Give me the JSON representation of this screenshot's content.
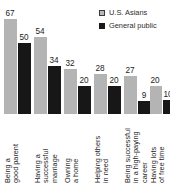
{
  "chart_data": {
    "type": "bar",
    "title": "",
    "subtitle": "",
    "xlabel": "",
    "ylabel": "",
    "ylim": [
      0,
      75
    ],
    "grid": false,
    "legend_position": "top-right",
    "orientation": "vertical",
    "grouping": "grouped",
    "categories": [
      "Being a\ngood parent",
      "Having a\nsuccessful\nmarriage",
      "Owning\na home",
      "Helping others\nin need",
      "Being successful\nin a high-paying\ncareer",
      "Having lots\nof free time"
    ],
    "series": [
      {
        "name": "U.S. Asians",
        "color": "#b4b4b4",
        "values": [
          67,
          54,
          32,
          28,
          27,
          20
        ]
      },
      {
        "name": "General public",
        "color": "#171717",
        "values": [
          50,
          34,
          20,
          20,
          9,
          10
        ]
      }
    ],
    "value_labels": [
      [
        "67",
        "50"
      ],
      [
        "54",
        "34"
      ],
      [
        "32",
        "20"
      ],
      [
        "28",
        "20"
      ],
      [
        "27",
        "9"
      ],
      [
        "20",
        "10"
      ]
    ]
  },
  "legend": {
    "entries": [
      {
        "label": "U.S. Asians",
        "swatch": "series-a"
      },
      {
        "label": "General public",
        "swatch": "series-b"
      }
    ]
  }
}
